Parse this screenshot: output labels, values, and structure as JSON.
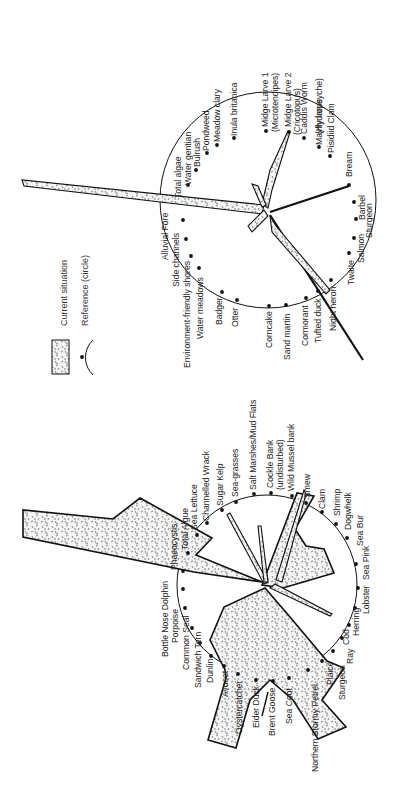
{
  "legend": {
    "current_situation": "Current situation",
    "reference": "Reference (circle)"
  },
  "colors": {
    "ink": "#111111",
    "fill_speckle_bg": "#f4f4f4",
    "background": "#ffffff"
  },
  "upper_diagram": {
    "labels": [
      "Total algae",
      "Water gentian",
      "Bulrush",
      "Pondweed",
      "Meadow clary",
      "Inula britanica",
      "Midge Larve 1",
      "(Microtendipes)",
      "Midge Larve 2",
      "(Cricotopus)",
      "Caddis Worm",
      "(Hydropsyche)",
      "Mayfly larve",
      "Pisidiid Clam",
      "Bream",
      "Barbel",
      "Sturgeon",
      "Salmon",
      "Twaite",
      "Night heron",
      "Tufted duck",
      "Cormorant",
      "Sand martin",
      "Corncake",
      "Otter",
      "Badger",
      "Water meadows",
      "Environment-friendly shores",
      "Side channels",
      "Alluvial Fore"
    ]
  },
  "lower_diagram": {
    "labels": [
      "Phaeocystis",
      "Total Algue",
      "Sea Lettuce",
      "Channelled Wrack",
      "Sugar Kelp",
      "Sea-grasses",
      "Salt Marshes/Mud Flats",
      "Cockle Bank",
      "(undisturbed)",
      "Wild Mussel bank",
      "Smew",
      "Clam",
      "Shrimp",
      "Dogwhelk",
      "Sea Bur",
      "Sea Pink",
      "Lobster",
      "Herring",
      "Cod",
      "Ray",
      "Sturgeon",
      "Plaice",
      "Northern Stormy Petrel",
      "Sea Coot",
      "Brent Goose",
      "Eider Duck",
      "Oystercatcher",
      "Avocet",
      "Dunlin",
      "Sandwich Tern",
      "Common Seal",
      "Porpoise",
      "Bottle Nose Dolphin"
    ]
  }
}
